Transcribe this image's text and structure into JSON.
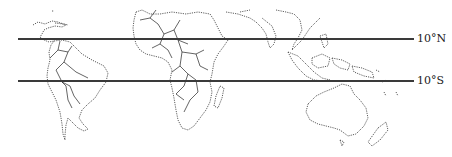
{
  "map": {
    "type": "world-outline-tropics",
    "lines": [
      {
        "label": "10°N",
        "y": 39
      },
      {
        "label": "10°S",
        "y": 81
      }
    ],
    "line_color": "#3a3a3a"
  }
}
